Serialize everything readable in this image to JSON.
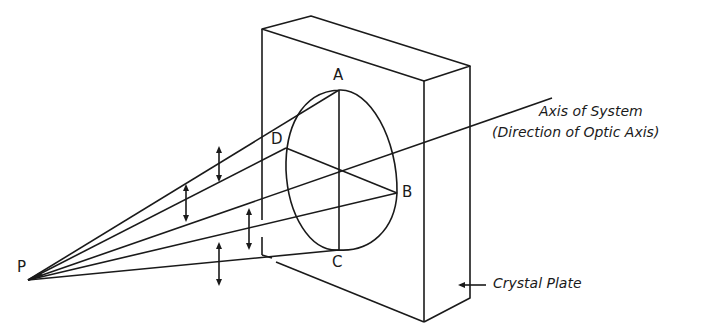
{
  "diagram": {
    "points": {
      "P": "P",
      "A": "A",
      "B": "B",
      "C": "C",
      "D": "D"
    },
    "labels": {
      "axis_line1": "Axis of System",
      "axis_line2": "(Direction of Optic Axis)",
      "crystal_plate": "Crystal Plate"
    },
    "colors": {
      "line": "#1a1a1a",
      "background": "#ffffff"
    }
  }
}
